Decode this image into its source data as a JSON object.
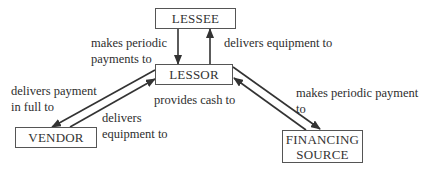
{
  "diagram": {
    "nodes": {
      "lessee": "LESSEE",
      "lessor": "LESSOR",
      "vendor": "VENDOR",
      "financing_line1": "FINANCING",
      "financing_line2": "SOURCE"
    },
    "edges": {
      "lessee_to_lessor_line1": "makes periodic",
      "lessee_to_lessor_line2": "payments to",
      "lessor_to_lessee": "delivers equipment to",
      "lessor_to_vendor_line1": "delivers payment",
      "lessor_to_vendor_line2": "in full to",
      "vendor_to_lessor_line1": "delivers",
      "vendor_to_lessor_line2": "equipment to",
      "financing_to_lessor": "provides cash to",
      "lessor_to_financing_line1": "makes periodic payment",
      "lessor_to_financing_line2": "to"
    },
    "colors": {
      "line": "#333333",
      "box_border": "#555555",
      "text": "#2e2e2e"
    }
  }
}
